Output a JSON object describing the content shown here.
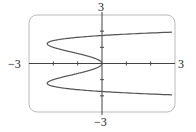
{
  "chart_data": {
    "type": "line",
    "title": "",
    "xlabel": "",
    "ylabel": "",
    "xlim": [
      -3,
      3
    ],
    "ylim": [
      -3,
      3
    ],
    "grid": false,
    "axis_labels": {
      "x_min": "−3",
      "x_max": "3",
      "y_min": "−3",
      "y_max": "3"
    },
    "x_ticks": [
      -2,
      -1,
      1,
      2
    ],
    "y_ticks": [
      -2,
      -1,
      1,
      2
    ],
    "series": [
      {
        "name": "curve",
        "description": "parametric curve x = y^4 - 3y^2",
        "points": [
          {
            "x": 3.0,
            "y": 1.95
          },
          {
            "x": 0.0,
            "y": 1.73
          },
          {
            "x": -2.25,
            "y": 1.22
          },
          {
            "x": -1.0,
            "y": 0.62
          },
          {
            "x": 0.0,
            "y": 0.0
          },
          {
            "x": -1.0,
            "y": -0.62
          },
          {
            "x": -2.25,
            "y": -1.22
          },
          {
            "x": 0.0,
            "y": -1.73
          },
          {
            "x": 3.0,
            "y": -1.95
          }
        ]
      }
    ],
    "colors": {
      "curve": "#555555",
      "axes": "#444444",
      "frame": "#bbbbbb"
    }
  }
}
